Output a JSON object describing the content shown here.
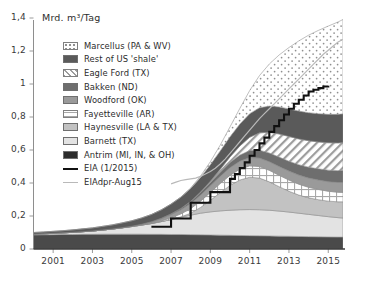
{
  "chart_data": {
    "type": "area",
    "title": "",
    "ylabel": "Mrd. m³/Tag",
    "xlabel": "",
    "ylim": [
      0,
      1.4
    ],
    "xlim": [
      2000,
      2015.75
    ],
    "ytick_labels": [
      "1,4",
      "1,2",
      "1",
      "0,8",
      "0,6",
      "0,4",
      "0,2",
      "0"
    ],
    "ytick_values": [
      1.4,
      1.2,
      1.0,
      0.8,
      0.6,
      0.4,
      0.2,
      0
    ],
    "xtick_labels": [
      "2001",
      "2003",
      "2005",
      "2007",
      "2009",
      "2011",
      "2013",
      "2015"
    ],
    "xtick_values": [
      2001,
      2003,
      2005,
      2007,
      2009,
      2011,
      2013,
      2015
    ],
    "grid": "y-axis ticks only",
    "legend_position": "upper-left inside plot",
    "stack_order_bottom_to_top": [
      "Antrim (MI, IN, & OH)",
      "Barnett (TX)",
      "Haynesville (LA & TX)",
      "Fayetteville (AR)",
      "Woodford (OK)",
      "Bakken (ND)",
      "Eagle Ford (TX)",
      "Rest of US 'shale'",
      "Marcellus (PA & WV)"
    ],
    "x": [
      2000,
      2000.5,
      2001,
      2001.5,
      2002,
      2002.5,
      2003,
      2003.5,
      2004,
      2004.5,
      2005,
      2005.5,
      2006,
      2006.5,
      2007,
      2007.5,
      2008,
      2008.5,
      2009,
      2009.5,
      2010,
      2010.5,
      2011,
      2011.5,
      2012,
      2012.5,
      2013,
      2013.5,
      2014,
      2014.5,
      2015,
      2015.5,
      2015.75
    ],
    "series": [
      {
        "name": "Antrim (MI, IN, & OH)",
        "key": "antrim",
        "fill": "#4a4a4a",
        "pattern": "solid-dark",
        "values": [
          0.085,
          0.086,
          0.087,
          0.088,
          0.088,
          0.089,
          0.089,
          0.09,
          0.09,
          0.09,
          0.09,
          0.09,
          0.089,
          0.089,
          0.088,
          0.088,
          0.087,
          0.086,
          0.085,
          0.084,
          0.083,
          0.082,
          0.081,
          0.08,
          0.079,
          0.078,
          0.077,
          0.076,
          0.075,
          0.074,
          0.073,
          0.072,
          0.072
        ]
      },
      {
        "name": "Barnett (TX)",
        "key": "barnett",
        "fill": "#e3e3e3",
        "pattern": "solid-light",
        "values": [
          0.005,
          0.006,
          0.008,
          0.01,
          0.013,
          0.016,
          0.02,
          0.025,
          0.031,
          0.038,
          0.046,
          0.055,
          0.065,
          0.077,
          0.09,
          0.104,
          0.118,
          0.131,
          0.14,
          0.147,
          0.152,
          0.156,
          0.158,
          0.158,
          0.156,
          0.152,
          0.147,
          0.141,
          0.135,
          0.129,
          0.123,
          0.118,
          0.116
        ]
      },
      {
        "name": "Haynesville (LA & TX)",
        "key": "haynesville",
        "fill": "#c2c2c2",
        "pattern": "solid-mid",
        "values": [
          0,
          0,
          0,
          0,
          0,
          0,
          0,
          0,
          0,
          0,
          0,
          0,
          0,
          0,
          0.001,
          0.003,
          0.012,
          0.035,
          0.07,
          0.11,
          0.15,
          0.18,
          0.196,
          0.192,
          0.172,
          0.148,
          0.126,
          0.11,
          0.1,
          0.096,
          0.094,
          0.096,
          0.098
        ]
      },
      {
        "name": "Fayetteville (AR)",
        "key": "fayetteville",
        "fill": "#ffffff",
        "pattern": "grid-hatch",
        "values": [
          0,
          0,
          0,
          0,
          0,
          0,
          0,
          0,
          0,
          0,
          0,
          0,
          0.001,
          0.004,
          0.01,
          0.018,
          0.028,
          0.038,
          0.048,
          0.056,
          0.062,
          0.066,
          0.069,
          0.07,
          0.07,
          0.069,
          0.068,
          0.066,
          0.064,
          0.062,
          0.06,
          0.058,
          0.057
        ]
      },
      {
        "name": "Woodford (OK)",
        "key": "woodford",
        "fill": "#9a9a9a",
        "pattern": "solid-mid-dark",
        "values": [
          0,
          0,
          0,
          0,
          0,
          0,
          0,
          0,
          0,
          0.001,
          0.002,
          0.004,
          0.008,
          0.013,
          0.019,
          0.025,
          0.031,
          0.036,
          0.04,
          0.043,
          0.046,
          0.048,
          0.05,
          0.051,
          0.052,
          0.053,
          0.054,
          0.055,
          0.056,
          0.057,
          0.058,
          0.059,
          0.06
        ]
      },
      {
        "name": "Bakken (ND)",
        "key": "bakken",
        "fill": "#6e6e6e",
        "pattern": "solid-darker",
        "values": [
          0,
          0,
          0,
          0,
          0,
          0,
          0,
          0,
          0,
          0,
          0,
          0.001,
          0.002,
          0.003,
          0.005,
          0.008,
          0.012,
          0.016,
          0.02,
          0.025,
          0.031,
          0.037,
          0.043,
          0.048,
          0.053,
          0.057,
          0.06,
          0.063,
          0.066,
          0.068,
          0.07,
          0.072,
          0.073
        ]
      },
      {
        "name": "Eagle Ford (TX)",
        "key": "eagleford",
        "fill": "#ffffff",
        "pattern": "diagonal-hatch",
        "values": [
          0,
          0,
          0,
          0,
          0,
          0,
          0,
          0,
          0,
          0,
          0,
          0,
          0,
          0,
          0,
          0,
          0.001,
          0.003,
          0.008,
          0.018,
          0.034,
          0.055,
          0.08,
          0.105,
          0.125,
          0.14,
          0.15,
          0.156,
          0.16,
          0.163,
          0.166,
          0.168,
          0.169
        ]
      },
      {
        "name": "Rest of US 'shale'",
        "key": "rest",
        "fill": "#5a5a5a",
        "pattern": "solid-dark2",
        "values": [
          0.01,
          0.011,
          0.012,
          0.013,
          0.015,
          0.017,
          0.019,
          0.022,
          0.025,
          0.029,
          0.033,
          0.038,
          0.044,
          0.051,
          0.059,
          0.068,
          0.078,
          0.089,
          0.1,
          0.111,
          0.122,
          0.133,
          0.143,
          0.152,
          0.159,
          0.164,
          0.167,
          0.169,
          0.17,
          0.171,
          0.172,
          0.173,
          0.174
        ]
      },
      {
        "name": "Marcellus (PA & WV)",
        "key": "marcellus",
        "fill": "#ffffff",
        "pattern": "dotted",
        "values": [
          0,
          0,
          0,
          0,
          0,
          0,
          0,
          0,
          0,
          0,
          0,
          0,
          0,
          0,
          0,
          0.001,
          0.003,
          0.008,
          0.018,
          0.035,
          0.06,
          0.095,
          0.14,
          0.195,
          0.255,
          0.315,
          0.372,
          0.425,
          0.47,
          0.505,
          0.535,
          0.56,
          0.572
        ]
      }
    ],
    "lines": [
      {
        "name": "EIA (1/2015)",
        "key": "eia",
        "color": "#111111",
        "width": 2.1,
        "style": "step",
        "x": [
          2006.0,
          2006.5,
          2007.0,
          2007.5,
          2008.0,
          2008.5,
          2009.0,
          2009.5,
          2010.0,
          2010.25,
          2010.5,
          2010.75,
          2011.0,
          2011.25,
          2011.5,
          2011.75,
          2012.0,
          2012.25,
          2012.5,
          2012.75,
          2013.0,
          2013.25,
          2013.5,
          2013.75,
          2014.0,
          2014.25,
          2014.5,
          2014.75,
          2015.0
        ],
        "values": [
          0.135,
          0.135,
          0.185,
          0.185,
          0.28,
          0.28,
          0.345,
          0.345,
          0.425,
          0.455,
          0.49,
          0.525,
          0.565,
          0.6,
          0.64,
          0.675,
          0.71,
          0.745,
          0.78,
          0.815,
          0.85,
          0.88,
          0.905,
          0.93,
          0.955,
          0.965,
          0.975,
          0.985,
          0.99
        ]
      },
      {
        "name": "EIAdpr-Aug15",
        "key": "eiadpr",
        "color": "#b9b9b9",
        "width": 1.2,
        "style": "line",
        "x": [
          2007.0,
          2007.25,
          2007.5,
          2007.75,
          2008.0,
          2008.25,
          2008.5,
          2008.75,
          2009.0,
          2009.25,
          2009.5,
          2009.75,
          2010.0,
          2010.25,
          2010.5,
          2010.75,
          2011.0,
          2011.25,
          2011.5,
          2011.75,
          2012.0,
          2012.25,
          2012.5,
          2012.75,
          2013.0,
          2013.25,
          2013.5,
          2013.75,
          2014.0,
          2014.25,
          2014.5,
          2014.75,
          2015.0,
          2015.25,
          2015.5,
          2015.75
        ],
        "values": [
          0.395,
          0.405,
          0.415,
          0.42,
          0.425,
          0.43,
          0.44,
          0.455,
          0.47,
          0.49,
          0.515,
          0.545,
          0.58,
          0.615,
          0.65,
          0.685,
          0.72,
          0.755,
          0.79,
          0.82,
          0.85,
          0.88,
          0.91,
          0.94,
          0.97,
          1.0,
          1.03,
          1.06,
          1.09,
          1.12,
          1.15,
          1.18,
          1.205,
          1.23,
          1.255,
          1.27
        ]
      }
    ]
  },
  "legend": {
    "items": [
      {
        "label": "Marcellus (PA & WV)",
        "key": "marcellus",
        "type": "swatch"
      },
      {
        "label": "Rest of US 'shale'",
        "key": "rest",
        "type": "swatch"
      },
      {
        "label": "Eagle Ford (TX)",
        "key": "eagleford",
        "type": "swatch"
      },
      {
        "label": "Bakken (ND)",
        "key": "bakken",
        "type": "swatch"
      },
      {
        "label": "Woodford (OK)",
        "key": "woodford",
        "type": "swatch"
      },
      {
        "label": "Fayetteville (AR)",
        "key": "fayetteville",
        "type": "swatch"
      },
      {
        "label": "Haynesville (LA & TX)",
        "key": "haynesville",
        "type": "swatch"
      },
      {
        "label": "Barnett (TX)",
        "key": "barnett",
        "type": "swatch"
      },
      {
        "label": "Antrim (MI, IN, & OH)",
        "key": "antrim",
        "type": "swatch"
      },
      {
        "label": "EIA (1/2015)",
        "key": "eia",
        "type": "line"
      },
      {
        "label": "EIAdpr-Aug15",
        "key": "eiadpr",
        "type": "line"
      }
    ]
  },
  "colors": {
    "axis": "#555555",
    "text": "#2b2b2b",
    "background": "#ffffff"
  }
}
